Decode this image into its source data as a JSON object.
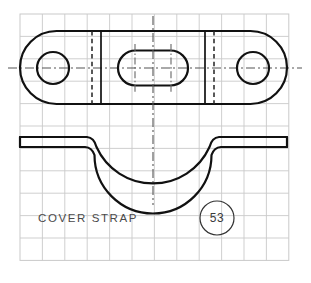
{
  "sheet": {
    "width": 311,
    "height": 283,
    "background_color": "#ffffff",
    "title": "COVER STRAP"
  },
  "grid": {
    "visible": true,
    "color": "#c9c9c9",
    "origin_x": 20,
    "origin_y": 14,
    "cell_size": 22.4,
    "cols": 12,
    "rows": 11
  },
  "labels": {
    "part_name": "COVER STRAP",
    "balloon_number": "53"
  },
  "balloon": {
    "cx": 217,
    "cy": 218,
    "r": 17,
    "label": "53"
  },
  "views": {
    "top_view": {
      "name": "top-view",
      "outline": {
        "left": 20,
        "right": 287,
        "top": 31,
        "bottom": 104,
        "corner_radius": 36.5,
        "center_y": 68
      },
      "left_hole": {
        "cx": 53,
        "cy": 68,
        "r": 16
      },
      "right_hole": {
        "cx": 253,
        "cy": 68,
        "r": 16
      },
      "center_slot": {
        "cx": 153,
        "cy": 68,
        "width": 72,
        "height": 35,
        "r": 17.5
      },
      "bend_lines_solid": [
        101,
        205
      ],
      "bend_lines_hidden": [
        92,
        214
      ]
    },
    "front_view": {
      "name": "front-view",
      "flange_top": 137,
      "flange_bottom": 147,
      "left": 20,
      "right": 287,
      "saddle_outer_radius": 62,
      "saddle_inner_radius": 53,
      "saddle_center_x": 153,
      "saddle_center_y": 130,
      "bottom_outer_y": 192,
      "bottom_inner_y": 184,
      "left_wall_x": 94,
      "right_wall_x": 212
    }
  },
  "centerlines": {
    "vertical_main_x": 153,
    "horizontal_top_view_y": 68,
    "slot_left_x": 135,
    "slot_right_x": 171
  },
  "colors": {
    "object": "#111111",
    "hidden": "#222222",
    "center": "#555555",
    "grid": "#c9c9c9",
    "text": "#4a4a4a"
  }
}
